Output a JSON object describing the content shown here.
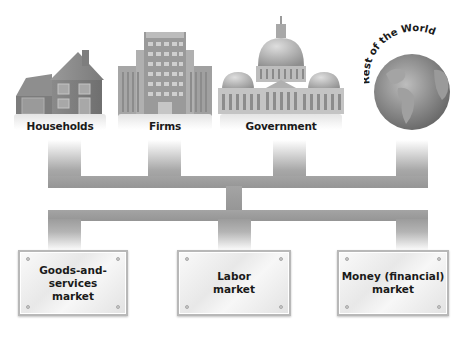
{
  "sectors": [
    {
      "id": "households",
      "label": "Households",
      "icon": "house-icon"
    },
    {
      "id": "firms",
      "label": "Firms",
      "icon": "office-building-icon"
    },
    {
      "id": "government",
      "label": "Government",
      "icon": "capitol-building-icon"
    },
    {
      "id": "rest_of_world",
      "label": "Rest of the World",
      "icon": "globe-icon"
    }
  ],
  "markets": [
    {
      "id": "goods_services",
      "line1": "Goods-and-services",
      "line2": "market"
    },
    {
      "id": "labor",
      "line1": "Labor",
      "line2": "market"
    },
    {
      "id": "money",
      "line1": "Money (financial)",
      "line2": "market"
    }
  ],
  "colors": {
    "connector": "#9e9e9e",
    "plaque_border": "#b8b8b8",
    "text": "#1a1a1a"
  }
}
